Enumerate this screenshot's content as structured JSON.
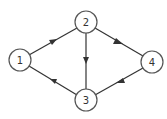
{
  "diagram": {
    "type": "directed-graph",
    "nodes": [
      {
        "id": "1",
        "label": "1",
        "x": 20,
        "y": 60
      },
      {
        "id": "2",
        "label": "2",
        "x": 86,
        "y": 22
      },
      {
        "id": "3",
        "label": "3",
        "x": 86,
        "y": 100
      },
      {
        "id": "4",
        "label": "4",
        "x": 152,
        "y": 62
      }
    ],
    "edges": [
      {
        "from": "1",
        "to": "2"
      },
      {
        "from": "2",
        "to": "3"
      },
      {
        "from": "2",
        "to": "4"
      },
      {
        "from": "3",
        "to": "1"
      },
      {
        "from": "4",
        "to": "3"
      }
    ],
    "colors": {
      "stroke": "#333333",
      "node_border": "#555555",
      "background": "#ffffff"
    }
  }
}
